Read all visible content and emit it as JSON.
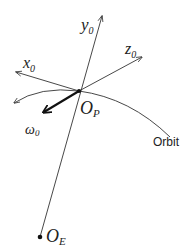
{
  "diagram": {
    "type": "orbital-reference-frame",
    "axes": [
      {
        "id": "x",
        "label": "x",
        "subscript": "0"
      },
      {
        "id": "y",
        "label": "y",
        "subscript": "0"
      },
      {
        "id": "z",
        "label": "z",
        "subscript": "0"
      }
    ],
    "points": [
      {
        "id": "op",
        "label": "O",
        "subscript": "P"
      },
      {
        "id": "oe",
        "label": "O",
        "subscript": "E"
      }
    ],
    "angular_velocity": {
      "label": "ω",
      "subscript": "0"
    },
    "orbit_label": "Orbit",
    "colors": {
      "line": "#333333",
      "background": "#ffffff"
    }
  }
}
